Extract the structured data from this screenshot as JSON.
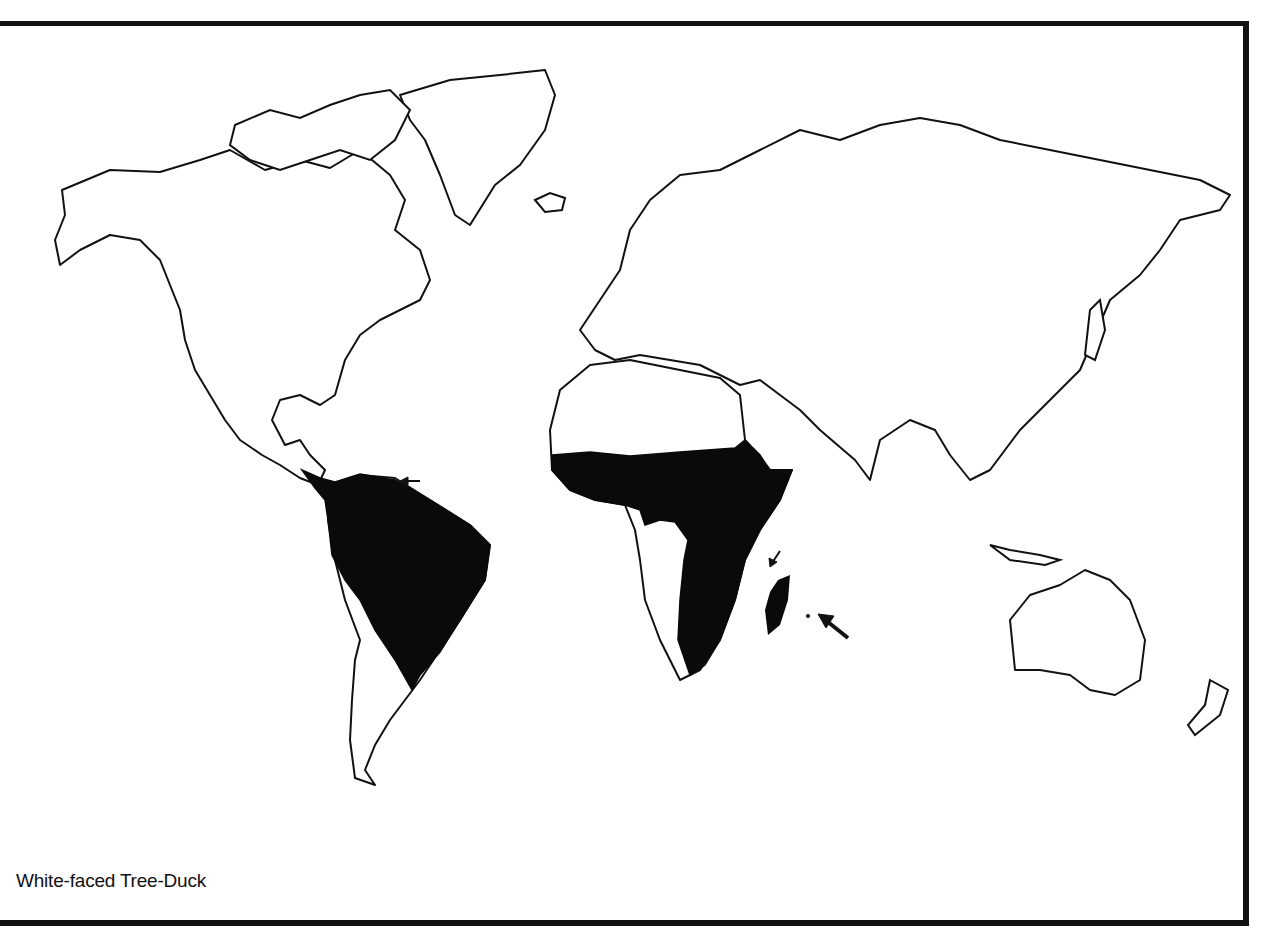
{
  "map": {
    "caption": "White-faced Tree-Duck",
    "type": "world distribution map",
    "colors": {
      "background": "#ffffff",
      "outline": "#111111",
      "range_fill": "#0a0a0a"
    },
    "range_regions": [
      "Central America (southern Mexico coast)",
      "Northern and central South America",
      "Sub-Saharan Africa (excluding southwest)",
      "Madagascar",
      "Comoro Islands",
      "Mascarene Islands"
    ],
    "arrows": [
      {
        "points_to": "Trinidad / Lesser Antilles",
        "size": "small"
      },
      {
        "points_to": "Comoro Islands",
        "size": "small"
      },
      {
        "points_to": "Mascarene Islands",
        "size": "large"
      }
    ]
  }
}
